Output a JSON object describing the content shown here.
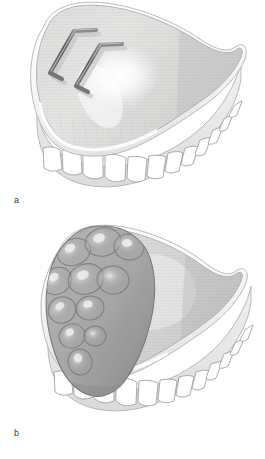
{
  "figure": {
    "kind": "medical-illustration",
    "background_color": "#ffffff",
    "panels": [
      {
        "id": "a",
        "label": "a",
        "caption_letter": "a",
        "description": "Upper complete denture showing two hook-shaped wire elements on the palatal surface",
        "overlay_kind": "wires",
        "overlay_count": 2
      },
      {
        "id": "b",
        "label": "b",
        "caption_letter": "b",
        "description": "Same upper complete denture with a large multi-lobed soft-tissue mass over the left anterior flange",
        "overlay_kind": "lobulated-mass",
        "lobule_count": 11
      }
    ]
  },
  "palette": {
    "background": "#ffffff",
    "outline": "#8a8a8a",
    "outline_dark": "#6f6f6f",
    "rim_white": "#fbfbfb",
    "rim_shadow": "#d8d8d8",
    "palate_light": "#e4e4e4",
    "palate_mid": "#d2d2d2",
    "palate_dark": "#bdbdbd",
    "palate_b_mid": "#cfcfcf",
    "flange_light": "#ededed",
    "flange_mid": "#dcdcdc",
    "tooth_fill": "#ffffff",
    "tooth_outline": "#9a9a9a",
    "wire_dark": "#6b6b6b",
    "wire_core": "#585858",
    "wire_highlight": "#b4b4b4",
    "mass_fill": "#a9a9a9",
    "mass_shadow": "#909090",
    "mass_highlight": "#d5d5d5",
    "mass_outline": "#7c7c7c",
    "label_text": "#3b3b3b"
  },
  "geometry": {
    "panel_a": {
      "teeth_count": 12,
      "wires": [
        {
          "name": "wire-upper",
          "path": "M 96 30 L 74 31 L 50 73 L 62 79"
        },
        {
          "name": "wire-lower",
          "path": "M 122 44 L 100 45 L 76 86 L 88 92"
        }
      ]
    },
    "panel_b": {
      "teeth_count": 12,
      "lobules": [
        {
          "cx": 74,
          "cy": 252,
          "rx": 17,
          "ry": 13,
          "rot": -22
        },
        {
          "cx": 103,
          "cy": 242,
          "rx": 18,
          "ry": 14,
          "rot": -12
        },
        {
          "cx": 129,
          "cy": 247,
          "rx": 15,
          "ry": 13,
          "rot": 8
        },
        {
          "cx": 57,
          "cy": 281,
          "rx": 15,
          "ry": 13,
          "rot": -35
        },
        {
          "cx": 86,
          "cy": 279,
          "rx": 18,
          "ry": 15,
          "rot": -18
        },
        {
          "cx": 113,
          "cy": 280,
          "rx": 16,
          "ry": 14,
          "rot": 5
        },
        {
          "cx": 62,
          "cy": 310,
          "rx": 14,
          "ry": 13,
          "rot": -28
        },
        {
          "cx": 90,
          "cy": 308,
          "rx": 14,
          "ry": 12,
          "rot": -10
        },
        {
          "cx": 72,
          "cy": 336,
          "rx": 13,
          "ry": 12,
          "rot": -20
        },
        {
          "cx": 95,
          "cy": 336,
          "rx": 11,
          "ry": 10,
          "rot": 0
        },
        {
          "cx": 80,
          "cy": 362,
          "rx": 12,
          "ry": 13,
          "rot": -12
        }
      ]
    }
  }
}
